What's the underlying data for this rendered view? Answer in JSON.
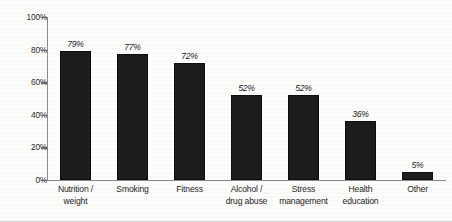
{
  "chart_data": {
    "type": "bar",
    "title": "",
    "xlabel": "",
    "ylabel": "",
    "ylim": [
      0,
      100
    ],
    "grid": false,
    "legend": "none",
    "y_ticks": [
      "0%",
      "20%",
      "40%",
      "60%",
      "80%",
      "100%"
    ],
    "y_tick_values": [
      0,
      20,
      40,
      60,
      80,
      100
    ],
    "categories": [
      "Nutrition /\nweight",
      "Smoking",
      "Fitness",
      "Alcohol /\ndrug abuse",
      "Stress\nmanagement",
      "Health\neducation",
      "Other"
    ],
    "values": [
      79,
      77,
      72,
      52,
      52,
      36,
      5
    ],
    "value_labels": [
      "79%",
      "77%",
      "72%",
      "52%",
      "52%",
      "36%",
      "5%"
    ],
    "bar_color": "#1c1c1c",
    "axis_color": "#8d8d8d",
    "background_color": "#fdfdfc"
  }
}
